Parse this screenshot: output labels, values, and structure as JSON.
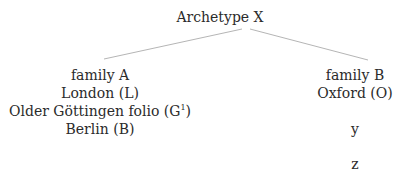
{
  "diagram": {
    "type": "stemma",
    "root": {
      "label": "Archetype X"
    },
    "branches": [
      {
        "family": "family A",
        "witnesses": [
          "London (L)",
          "Older Göttingen folio (G",
          "Berlin (B)"
        ],
        "witness_superscripts": {
          "1": "1"
        },
        "witness_suffixes": {
          "1": ")"
        }
      },
      {
        "family": "family B",
        "witnesses": [
          "Oxford (O)"
        ],
        "descendants": [
          "y",
          "z"
        ]
      }
    ],
    "edge_color": "#b0b0b0"
  }
}
